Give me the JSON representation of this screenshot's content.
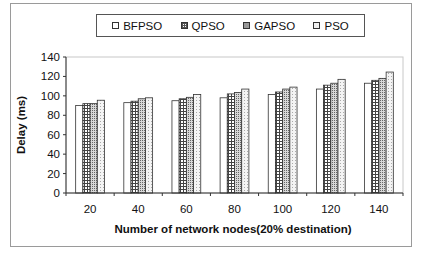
{
  "chart_data": {
    "type": "bar",
    "title": "",
    "xlabel": "Number of network nodes(20% destination)",
    "ylabel": "Delay (ms)",
    "ylim": [
      0,
      140
    ],
    "yticks": [
      0,
      20,
      40,
      60,
      80,
      100,
      120,
      140
    ],
    "grid": false,
    "legend_position": "top",
    "categories": [
      "20",
      "40",
      "60",
      "80",
      "100",
      "120",
      "140"
    ],
    "series": [
      {
        "name": "BFPSO",
        "pattern": "white",
        "values": [
          90,
          93,
          95,
          98,
          101.5,
          107,
          113
        ]
      },
      {
        "name": "QPSO",
        "pattern": "dotted-grid",
        "values": [
          92,
          94.5,
          97,
          102,
          104,
          111,
          116
        ]
      },
      {
        "name": "GAPSO",
        "pattern": "dense-grid",
        "values": [
          92,
          97,
          98.5,
          103.5,
          107,
          113,
          118
        ]
      },
      {
        "name": "PSO",
        "pattern": "light-dots",
        "values": [
          95.5,
          98,
          101.5,
          107,
          109,
          117,
          124.5
        ]
      }
    ]
  },
  "legend": {
    "items": [
      {
        "label": "BFPSO"
      },
      {
        "label": "QPSO"
      },
      {
        "label": "GAPSO"
      },
      {
        "label": "PSO"
      }
    ]
  },
  "axes": {
    "x_title": "Number of network nodes(20% destination)",
    "y_title": "Delay (ms)"
  }
}
